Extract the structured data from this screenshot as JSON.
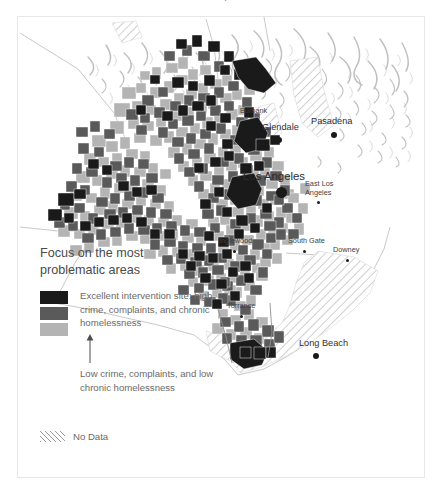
{
  "title": "Focus on the most problematic areas",
  "legend": {
    "heading": "Focus on the most problematic areas",
    "high_label": "Excellent intervention site: high crime, complaints, and chronic homelessness",
    "low_label": "Low crime, complaints, and low chronic homelessness",
    "nodata_label": "No Data",
    "arrow_icon": "up-arrow-icon",
    "swatches": [
      {
        "name": "swatch-high",
        "color": "#1a1a1a"
      },
      {
        "name": "swatch-medium",
        "color": "#5a5a5a"
      },
      {
        "name": "swatch-low",
        "color": "#b4b4b4"
      }
    ],
    "nodata_pattern": "diagonal-hatch"
  },
  "map": {
    "basemap": "hillshade-terrain",
    "region": "Los Angeles County, California",
    "cities": [
      {
        "name": "Burbank",
        "size": "small",
        "x": 222,
        "y": 90,
        "dot_dx": 14,
        "dot_dy": 13
      },
      {
        "name": "Glendale",
        "size": "mid",
        "x": 244,
        "y": 106,
        "dot_dx": 14,
        "dot_dy": 14
      },
      {
        "name": "Pasadena",
        "size": "mid",
        "x": 293,
        "y": 100,
        "dot_dx": 20,
        "dot_dy": 15
      },
      {
        "name": "Los Angeles",
        "size": "major",
        "x": 225,
        "y": 154,
        "dot_dx": 33,
        "dot_dy": 16
      },
      {
        "name": "East Los Angeles",
        "size": "small",
        "x": 287,
        "y": 163,
        "dot_dx": 12,
        "dot_dy": 21
      },
      {
        "name": "Inglewood",
        "size": "small",
        "x": 201,
        "y": 220,
        "dot_dx": 14,
        "dot_dy": 13
      },
      {
        "name": "South Gate",
        "size": "small",
        "x": 270,
        "y": 220,
        "dot_dx": 15,
        "dot_dy": 13
      },
      {
        "name": "Downey",
        "size": "small",
        "x": 315,
        "y": 229,
        "dot_dx": 13,
        "dot_dy": 13
      },
      {
        "name": "Torrance",
        "size": "small",
        "x": 209,
        "y": 285,
        "dot_dx": 13,
        "dot_dy": 13
      },
      {
        "name": "Long Beach",
        "size": "mid",
        "x": 281,
        "y": 322,
        "dot_dx": 14,
        "dot_dy": 14
      }
    ]
  },
  "colors": {
    "high": "#1a1a1a",
    "medium": "#5a5a5a",
    "low": "#b4b4b4",
    "nodata_hatch": "#9b9b9b",
    "frame": "#e7e7e7",
    "text": "#5d5d5d",
    "background": "#ffffff"
  }
}
